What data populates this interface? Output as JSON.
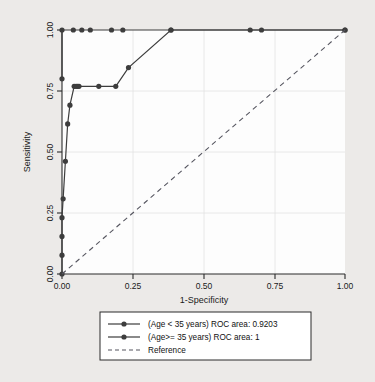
{
  "chart_data": {
    "type": "line",
    "title": "",
    "subtitle": "",
    "xlabel": "1-Specificity",
    "ylabel": "Sensitivity",
    "xlim": [
      0,
      1
    ],
    "ylim": [
      0,
      1
    ],
    "xticks": [
      "0.00",
      "0.25",
      "0.50",
      "0.75",
      "1.00"
    ],
    "xtick_values": [
      0,
      0.25,
      0.5,
      0.75,
      1
    ],
    "yticks": [
      "0.00",
      "0.25",
      "0.50",
      "0.75",
      "1.00"
    ],
    "ytick_values": [
      0,
      0.25,
      0.5,
      0.75,
      1
    ],
    "grid": true,
    "legend_position": "below-center",
    "series": [
      {
        "name": "(Age < 35 years) ROC area: 0.9203",
        "style": "solid",
        "marker": "circle",
        "color": "#3d3d3d",
        "points": [
          [
            0.0,
            0.0
          ],
          [
            0.0,
            0.077
          ],
          [
            0.0,
            0.154
          ],
          [
            0.0,
            0.231
          ],
          [
            0.004,
            0.308
          ],
          [
            0.012,
            0.462
          ],
          [
            0.02,
            0.615
          ],
          [
            0.028,
            0.692
          ],
          [
            0.043,
            0.769
          ],
          [
            0.05,
            0.769
          ],
          [
            0.055,
            0.769
          ],
          [
            0.06,
            0.769
          ],
          [
            0.13,
            0.769
          ],
          [
            0.19,
            0.769
          ],
          [
            0.235,
            0.846
          ],
          [
            0.385,
            1.0
          ],
          [
            1.0,
            1.0
          ]
        ]
      },
      {
        "name": "(Age>= 35 years) ROC area: 1",
        "style": "solid",
        "marker": "circle",
        "color": "#3d3d3d",
        "points": [
          [
            0.0,
            0.8
          ],
          [
            0.0,
            1.0
          ],
          [
            0.04,
            1.0
          ],
          [
            0.07,
            1.0
          ],
          [
            0.1,
            1.0
          ],
          [
            0.175,
            1.0
          ],
          [
            0.215,
            1.0
          ],
          [
            0.385,
            1.0
          ],
          [
            0.665,
            1.0
          ],
          [
            0.705,
            1.0
          ],
          [
            1.0,
            1.0
          ]
        ]
      },
      {
        "name": "Reference",
        "style": "dashed",
        "marker": "none",
        "color": "#55555f",
        "points": [
          [
            0.0,
            0.0
          ],
          [
            1.0,
            1.0
          ]
        ]
      }
    ],
    "legend_entries": [
      {
        "label": "(Age < 35 years) ROC area: 0.9203",
        "style": "solid",
        "marker": "circle"
      },
      {
        "label": "(Age>= 35 years) ROC area: 1",
        "style": "solid",
        "marker": "circle"
      },
      {
        "label": "Reference",
        "style": "dashed",
        "marker": "none"
      }
    ]
  }
}
